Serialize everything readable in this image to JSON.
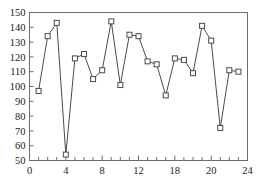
{
  "chart_data": {
    "type": "line",
    "title": "",
    "subtitle": "",
    "xlabel": "",
    "ylabel": "",
    "x": [
      1,
      2,
      3,
      4,
      5,
      6,
      7,
      8,
      9,
      10,
      11,
      12,
      13,
      14,
      15,
      16,
      17,
      18,
      19,
      20,
      21,
      22,
      23
    ],
    "values": [
      97,
      134,
      143,
      54,
      119,
      122,
      105,
      111,
      144,
      101,
      135,
      134,
      117,
      115,
      94,
      119,
      118,
      109,
      141,
      131,
      72,
      111,
      110
    ],
    "series": [
      {
        "name": "series-1",
        "values": [
          97,
          134,
          143,
          54,
          119,
          122,
          105,
          111,
          144,
          101,
          135,
          134,
          117,
          115,
          94,
          119,
          118,
          109,
          141,
          131,
          72,
          111,
          110
        ]
      }
    ],
    "xlim": [
      0,
      24
    ],
    "ylim": [
      50,
      150
    ],
    "xticks": [
      0,
      1,
      2,
      3,
      4,
      5,
      6,
      7,
      8,
      9,
      10,
      11,
      12,
      13,
      14,
      15,
      16,
      17,
      18,
      19,
      20,
      21,
      22,
      23,
      24
    ],
    "yticks": [
      50,
      60,
      70,
      80,
      90,
      100,
      110,
      120,
      130,
      140,
      150
    ],
    "xtick_labels": [
      {
        "value": 0,
        "label": "0"
      },
      {
        "value": 4,
        "label": "4"
      },
      {
        "value": 8,
        "label": "8"
      },
      {
        "value": 12,
        "label": "12"
      },
      {
        "value": 16,
        "label": "18"
      },
      {
        "value": 20,
        "label": "20"
      },
      {
        "value": 24,
        "label": "24"
      }
    ],
    "ytick_labels": [
      {
        "value": 150,
        "label": "150"
      },
      {
        "value": 140,
        "label": "140"
      },
      {
        "value": 130,
        "label": "130"
      },
      {
        "value": 120,
        "label": "120"
      },
      {
        "value": 110,
        "label": "110"
      },
      {
        "value": 100,
        "label": "100"
      },
      {
        "value": 90,
        "label": "90"
      },
      {
        "value": 80,
        "label": "80"
      },
      {
        "value": 70,
        "label": "70"
      },
      {
        "value": 60,
        "label": "60"
      },
      {
        "value": 50,
        "label": "50"
      }
    ],
    "grid": false,
    "legend": null,
    "marker_style": "open-square",
    "colors": {
      "line": "#4a4a4a",
      "marker_fill": "#ffffff",
      "marker_stroke": "#4a4a4a",
      "axis": "#6d6d6d",
      "text": "#1a1a1a",
      "background": "#ffffff"
    }
  }
}
